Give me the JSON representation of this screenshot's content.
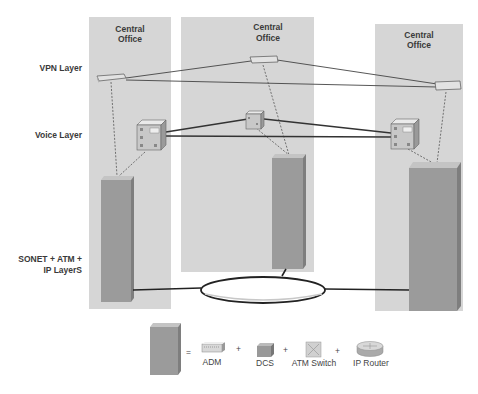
{
  "diagram": {
    "offices": [
      {
        "label_line1": "Central",
        "label_line2": "Office"
      },
      {
        "label_line1": "Central",
        "label_line2": "Office"
      },
      {
        "label_line1": "Central",
        "label_line2": "Office"
      }
    ],
    "layers": {
      "vpn": "VPN Layer",
      "voice": "Voice Layer",
      "transport_line1": "SONET + ATM +",
      "transport_line2": "IP LayerS"
    },
    "legend": {
      "equals": "=",
      "plus": "+",
      "items": [
        {
          "label": "ADM",
          "icon": "adm-icon"
        },
        {
          "label": "DCS",
          "icon": "dcs-icon"
        },
        {
          "label": "ATM Switch",
          "icon": "atm-switch-icon"
        },
        {
          "label": "IP Router",
          "icon": "ip-router-icon"
        }
      ]
    },
    "colors": {
      "office_bg": "#d6d6d6",
      "tower_front": "#9b9b9b",
      "tower_side": "#7e7e7e",
      "tower_top": "#c4c4c4",
      "line": "#333333"
    }
  }
}
